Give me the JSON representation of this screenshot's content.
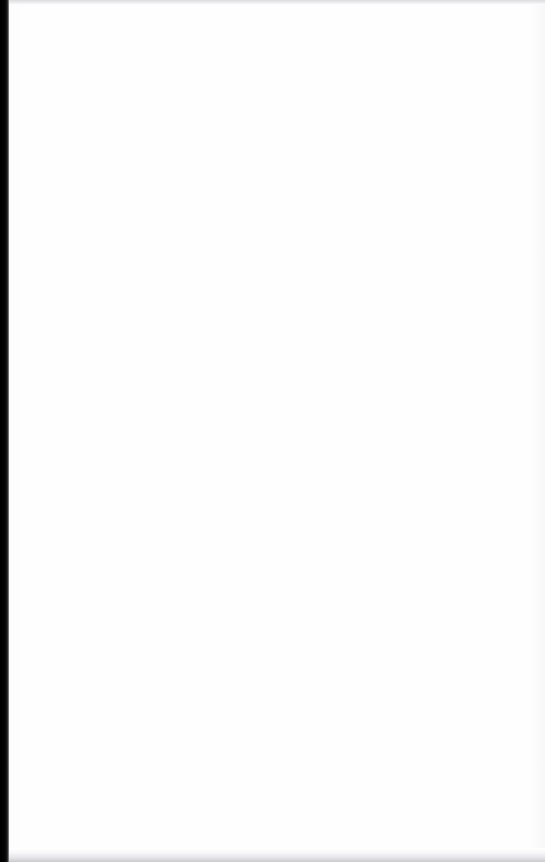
{
  "document": {
    "page_state": "blank",
    "content_text": "",
    "orientation": "portrait",
    "page_width_px": 545,
    "page_height_px": 862,
    "description": "Blank white scanned page with a dark binding gutter along the left edge"
  },
  "colors": {
    "page_background": "#fefefe",
    "canvas_background": "#ffffff",
    "binding_gutter": "#000000",
    "edge_band_top": "#dcdce0",
    "edge_band_bottom": "#c9c9ce",
    "inner_shadow": "#d8d8dc"
  },
  "regions": {
    "binding_gutter_label": "",
    "edge_band_top_label": "",
    "edge_band_bottom_label": "",
    "content_area_label": ""
  }
}
